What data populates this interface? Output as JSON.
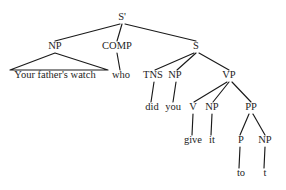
{
  "diagram": {
    "type": "syntax-tree",
    "sentence": "Your father's watch who did you give it to t",
    "width": 286,
    "height": 190,
    "background_color": "#ffffff",
    "line_color": "#1a1a1a",
    "text_color": "#1d1d1d"
  },
  "nodes": [
    {
      "id": "sbar",
      "label": "S'",
      "x": 122,
      "y": 20,
      "kind": "nonterminal"
    },
    {
      "id": "np1",
      "label": "NP",
      "x": 55,
      "y": 49,
      "kind": "nonterminal"
    },
    {
      "id": "comp",
      "label": "COMP",
      "x": 117,
      "y": 49,
      "kind": "nonterminal"
    },
    {
      "id": "s",
      "label": "S",
      "x": 196,
      "y": 49,
      "kind": "nonterminal"
    },
    {
      "id": "phrase1",
      "label": "Your father's watch",
      "x": 55,
      "y": 78,
      "kind": "terminal"
    },
    {
      "id": "who",
      "label": "who",
      "x": 121,
      "y": 78,
      "kind": "terminal"
    },
    {
      "id": "tns",
      "label": "TNS",
      "x": 153,
      "y": 78,
      "kind": "nonterminal"
    },
    {
      "id": "np2",
      "label": "NP",
      "x": 175,
      "y": 78,
      "kind": "nonterminal"
    },
    {
      "id": "vp",
      "label": "VP",
      "x": 229,
      "y": 78,
      "kind": "nonterminal"
    },
    {
      "id": "did",
      "label": "did",
      "x": 152,
      "y": 110,
      "kind": "terminal"
    },
    {
      "id": "you",
      "label": "you",
      "x": 173,
      "y": 110,
      "kind": "terminal"
    },
    {
      "id": "v",
      "label": "V",
      "x": 193,
      "y": 110,
      "kind": "nonterminal"
    },
    {
      "id": "np3",
      "label": "NP",
      "x": 212,
      "y": 110,
      "kind": "nonterminal"
    },
    {
      "id": "pp",
      "label": "PP",
      "x": 251,
      "y": 110,
      "kind": "nonterminal"
    },
    {
      "id": "give",
      "label": "give",
      "x": 193,
      "y": 143,
      "kind": "terminal"
    },
    {
      "id": "it",
      "label": "it",
      "x": 212,
      "y": 143,
      "kind": "terminal"
    },
    {
      "id": "p",
      "label": "P",
      "x": 241,
      "y": 143,
      "kind": "nonterminal"
    },
    {
      "id": "np4",
      "label": "NP",
      "x": 265,
      "y": 143,
      "kind": "nonterminal"
    },
    {
      "id": "to",
      "label": "to",
      "x": 241,
      "y": 176,
      "kind": "terminal"
    },
    {
      "id": "trace",
      "label": "t",
      "x": 265,
      "y": 176,
      "kind": "terminal"
    }
  ],
  "edges": [
    {
      "from": "sbar",
      "to": "np1",
      "x1": 120,
      "y1": 24,
      "x2": 55,
      "y2": 41
    },
    {
      "from": "sbar",
      "to": "comp",
      "x1": 122,
      "y1": 24,
      "x2": 117,
      "y2": 41
    },
    {
      "from": "sbar",
      "to": "s",
      "x1": 125,
      "y1": 24,
      "x2": 196,
      "y2": 41
    },
    {
      "from": "comp",
      "to": "who",
      "x1": 117,
      "y1": 53,
      "x2": 120,
      "y2": 70
    },
    {
      "from": "s",
      "to": "tns",
      "x1": 194,
      "y1": 53,
      "x2": 155,
      "y2": 70
    },
    {
      "from": "s",
      "to": "np2",
      "x1": 196,
      "y1": 53,
      "x2": 177,
      "y2": 70
    },
    {
      "from": "s",
      "to": "vp",
      "x1": 199,
      "y1": 53,
      "x2": 229,
      "y2": 70
    },
    {
      "from": "tns",
      "to": "did",
      "x1": 154,
      "y1": 82,
      "x2": 151,
      "y2": 102
    },
    {
      "from": "np2",
      "to": "you",
      "x1": 176,
      "y1": 82,
      "x2": 173,
      "y2": 102
    },
    {
      "from": "vp",
      "to": "v",
      "x1": 227,
      "y1": 82,
      "x2": 194,
      "y2": 102
    },
    {
      "from": "vp",
      "to": "np3",
      "x1": 229,
      "y1": 82,
      "x2": 213,
      "y2": 102
    },
    {
      "from": "vp",
      "to": "pp",
      "x1": 232,
      "y1": 82,
      "x2": 251,
      "y2": 102
    },
    {
      "from": "v",
      "to": "give",
      "x1": 193,
      "y1": 114,
      "x2": 192,
      "y2": 135
    },
    {
      "from": "np3",
      "to": "it",
      "x1": 212,
      "y1": 114,
      "x2": 211,
      "y2": 135
    },
    {
      "from": "pp",
      "to": "p",
      "x1": 249,
      "y1": 114,
      "x2": 240,
      "y2": 135
    },
    {
      "from": "pp",
      "to": "np4",
      "x1": 253,
      "y1": 114,
      "x2": 265,
      "y2": 135
    },
    {
      "from": "p",
      "to": "to",
      "x1": 240,
      "y1": 147,
      "x2": 239,
      "y2": 168
    },
    {
      "from": "np4",
      "to": "trace",
      "x1": 265,
      "y1": 147,
      "x2": 264,
      "y2": 168
    }
  ],
  "triangles": [
    {
      "from": "np1",
      "to": "phrase1",
      "apex_x": 55,
      "apex_y": 53,
      "left_x": 10,
      "left_y": 70,
      "right_x": 108,
      "right_y": 70
    }
  ]
}
